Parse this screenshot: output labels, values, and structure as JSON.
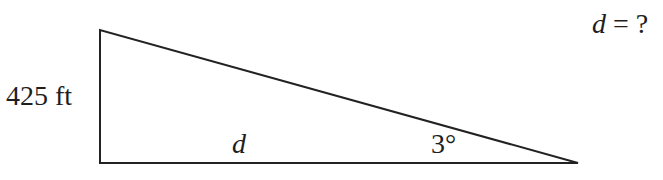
{
  "diagram": {
    "type": "right-triangle",
    "vertices": {
      "top_left": [
        100,
        30
      ],
      "bottom_left": [
        100,
        163
      ],
      "right": [
        578,
        163
      ]
    },
    "stroke_color": "#222222",
    "labels": {
      "height": "425 ft",
      "base": "d",
      "angle": "3°"
    },
    "question": {
      "variable": "d",
      "rest": " = ?"
    }
  }
}
